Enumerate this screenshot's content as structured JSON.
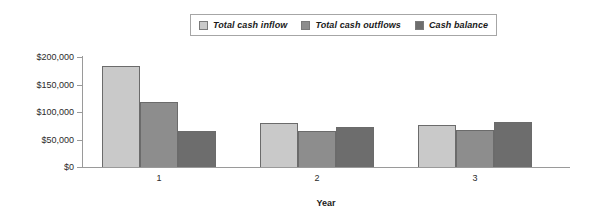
{
  "chart_data": {
    "type": "bar",
    "title": "",
    "xlabel": "Year",
    "ylabel": "",
    "categories": [
      "1",
      "2",
      "3"
    ],
    "series": [
      {
        "name": "Total cash inflow",
        "color": "#c9c9c9",
        "values": [
          183000,
          80000,
          76000
        ]
      },
      {
        "name": "Total cash outflows",
        "color": "#8d8d8d",
        "values": [
          118000,
          66000,
          67000
        ]
      },
      {
        "name": "Cash balance",
        "color": "#6d6d6d",
        "values": [
          65500,
          73000,
          82000
        ]
      }
    ],
    "ylim": [
      0,
      200000
    ],
    "yticks": [
      0,
      50000,
      100000,
      150000,
      200000
    ],
    "ytick_labels": [
      "$0",
      "$50,000",
      "$100,000",
      "$150,000",
      "$200,000"
    ],
    "grid": false,
    "legend_position": "top-center"
  },
  "legend": {
    "items": [
      {
        "label": "Total cash inflow"
      },
      {
        "label": "Total cash outflows"
      },
      {
        "label": "Cash balance"
      }
    ]
  },
  "axes": {
    "x_title": "Year",
    "x_categories": [
      "1",
      "2",
      "3"
    ],
    "y_labels": [
      "$200,000",
      "$150,000",
      "$100,000",
      "$50,000",
      "$0"
    ]
  }
}
